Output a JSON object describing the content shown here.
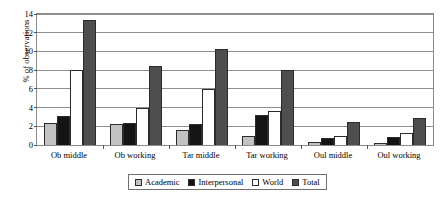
{
  "chart_data": {
    "type": "bar",
    "title": "",
    "xlabel": "",
    "ylabel": "% of observations",
    "ylim": [
      0,
      14
    ],
    "ytick_step": 2,
    "yticks": [
      0,
      2,
      4,
      6,
      8,
      10,
      12,
      14
    ],
    "grid": "horizontal",
    "legend_position": "bottom",
    "categories": [
      "Ob middle",
      "Ob working",
      "Tar middle",
      "Tar working",
      "Oul middle",
      "Oul working"
    ],
    "series": [
      {
        "name": "Academic",
        "color": "#c2c2c2",
        "values": [
          2.3,
          2.2,
          1.6,
          1.0,
          0.3,
          0.2
        ]
      },
      {
        "name": "Interpersonal",
        "color": "#141414",
        "values": [
          3.1,
          2.3,
          2.2,
          3.2,
          0.8,
          0.9
        ]
      },
      {
        "name": "World",
        "color": "#ffffff",
        "values": [
          8.0,
          4.0,
          6.0,
          3.6,
          1.0,
          1.3
        ]
      },
      {
        "name": "Total",
        "color": "#4e4e4e",
        "values": [
          13.4,
          8.4,
          10.3,
          8.0,
          2.5,
          2.9
        ]
      }
    ]
  }
}
